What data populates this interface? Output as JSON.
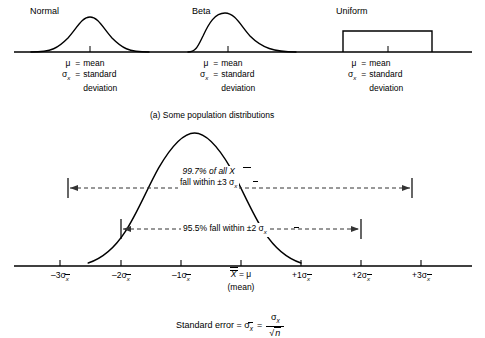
{
  "figure": {
    "panel_a_caption": "(a) Some population distributions",
    "distributions": [
      {
        "name": "Normal",
        "shape": "symmetric-bell"
      },
      {
        "name": "Beta",
        "shape": "right-skewed"
      },
      {
        "name": "Uniform",
        "shape": "rectangle"
      }
    ],
    "legend": {
      "mu_symbol": "μ",
      "mu_equals": "=",
      "mu_text": "mean",
      "sigma_symbol": "σ",
      "sigma_subscript": "x",
      "sigma_equals": "=",
      "sigma_text_line1": "standard",
      "sigma_text_line2": "deviation"
    },
    "sampling_curve": {
      "annotation_997_line1": "99.7% of all X",
      "annotation_997_line2": "fall within ±3 σ",
      "annotation_997_sub": "x",
      "annotation_955": "95.5% fall within ±2 σ",
      "annotation_955_sub": "x",
      "axis_ticks": [
        {
          "sign": "–3",
          "sigma": "σ",
          "sub": "x"
        },
        {
          "sign": "–2",
          "sigma": "σ",
          "sub": "x"
        },
        {
          "sign": "–1",
          "sigma": "σ",
          "sub": "x"
        },
        {
          "sign": "",
          "sigma": "",
          "sub": ""
        },
        {
          "sign": "+1",
          "sigma": "σ",
          "sub": "x"
        },
        {
          "sign": "+2",
          "sigma": "σ",
          "sub": "x"
        },
        {
          "sign": "+3",
          "sigma": "σ",
          "sub": "x"
        }
      ],
      "center_label": "X",
      "center_equals": "= μ",
      "center_sublabel": "(mean)",
      "formula_prefix": "Standard error = σ",
      "formula_prefix_sub": "x",
      "formula_equals": "=",
      "formula_numerator": "σ",
      "formula_numerator_sub": "x",
      "formula_denominator": "n",
      "formula_radical": "√"
    },
    "colors": {
      "ink": "#000000",
      "background": "#ffffff",
      "dashed": "#555555"
    }
  }
}
